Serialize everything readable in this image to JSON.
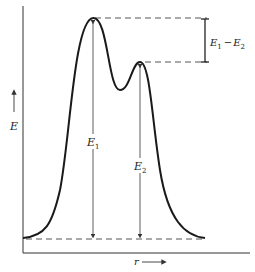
{
  "diagram": {
    "type": "potential-energy-curve",
    "axes": {
      "y_label": "E",
      "x_label": "r"
    },
    "labels": {
      "e1": "E",
      "e1_sub": "1",
      "e2": "E",
      "e2_sub": "2",
      "diff_a": "E",
      "diff_a_sub": "1",
      "diff_minus": "−",
      "diff_b": "E",
      "diff_b_sub": "2"
    },
    "features": {
      "peak1": {
        "x": 93,
        "y": 18
      },
      "peak2": {
        "x": 140,
        "y": 63
      },
      "valley": {
        "x": 120,
        "y": 90
      },
      "baseline_y": 239
    },
    "colors": {
      "line": "#1a1a1a",
      "dashed": "#555555",
      "background": "#ffffff"
    }
  }
}
